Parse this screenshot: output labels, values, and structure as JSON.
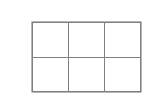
{
  "canvas": {
    "width": 153,
    "height": 99,
    "background_color": "#ffffff"
  },
  "grid": {
    "name": "empty-grid-table",
    "columns": 3,
    "rows": 2,
    "border_color": "#7f7f7f",
    "outer_border_color": "#6e6e6e",
    "cell_background": "#ffffff",
    "bounds": {
      "left": 32,
      "top": 22,
      "width": 109,
      "height": 70
    },
    "column_dividers_x": [
      68,
      105
    ],
    "row_dividers_y": [
      57
    ],
    "cells": [
      [
        "",
        "",
        ""
      ],
      [
        "",
        "",
        ""
      ]
    ]
  }
}
